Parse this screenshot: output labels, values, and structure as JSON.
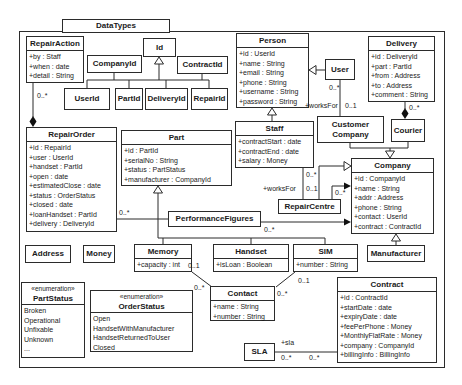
{
  "package": {
    "title": "DataTypes"
  },
  "colors": {
    "line": "#2b2b2b",
    "background": "#ffffff"
  },
  "classes": {
    "repairAction": {
      "name": "RepairAction",
      "attributes": [
        "+by : Staff",
        "+when : date",
        "+detail : String"
      ]
    },
    "id": {
      "name": "Id"
    },
    "companyId": {
      "name": "CompanyId"
    },
    "contractId": {
      "name": "ContractId"
    },
    "userId": {
      "name": "UserId"
    },
    "partId": {
      "name": "PartId"
    },
    "deliveryId": {
      "name": "DeliveryId"
    },
    "repairId": {
      "name": "RepairId"
    },
    "person": {
      "name": "Person",
      "attributes": [
        "+id : UserId",
        "+name : String",
        "+email : String",
        "+phone : String",
        "+username : String",
        "+password : String"
      ]
    },
    "user": {
      "name": "User"
    },
    "delivery": {
      "name": "Delivery",
      "attributes": [
        "+id : DeliveryId",
        "+part : PartId",
        "+from : Address",
        "+to : Address",
        "+comment : String"
      ]
    },
    "repairOrder": {
      "name": "RepairOrder",
      "attributes": [
        "+id : RepairId",
        "+user : UserId",
        "+handset : PartId",
        "+open : date",
        "+estimatedClose : date",
        "+status : OrderStatus",
        "+closed : date",
        "+loanHandset : PartId",
        "+delivery : DeliveryId"
      ]
    },
    "part": {
      "name": "Part",
      "attributes": [
        "+id : PartId",
        "+serialNo : String",
        "+status : PartStatus",
        "+manufacturer : CompanyId"
      ]
    },
    "staff": {
      "name": "Staff",
      "attributes": [
        "+contractStart : date",
        "+contractEnd : date",
        "+salary : Money"
      ]
    },
    "customerCompany": {
      "name": "Customer Company"
    },
    "courier": {
      "name": "Courier"
    },
    "company": {
      "name": "Company",
      "attributes": [
        "+id : CompanyId",
        "+name : String",
        "+addr : Address",
        "+phone : String",
        "+contact : UserId",
        "+contract : ContractId"
      ]
    },
    "repairCentre": {
      "name": "RepairCentre"
    },
    "performanceFigures": {
      "name": "PerformanceFigures"
    },
    "address": {
      "name": "Address"
    },
    "money": {
      "name": "Money"
    },
    "memory": {
      "name": "Memory",
      "attributes": [
        "+capacity : int"
      ]
    },
    "handset": {
      "name": "Handset",
      "attributes": [
        "+isLoan : Boolean"
      ]
    },
    "sim": {
      "name": "SIM",
      "attributes": [
        "+number : String"
      ]
    },
    "manufacturer": {
      "name": "Manufacturer"
    },
    "partStatus": {
      "stereotype": "«enumeration»",
      "name": "PartStatus",
      "literals": [
        "Broken",
        "Operational",
        "Unfixable",
        "Unknown",
        "..."
      ]
    },
    "orderStatus": {
      "stereotype": "«enumeration»",
      "name": "OrderStatus",
      "literals": [
        "Open",
        "HandsetWithManufacturer",
        "HandsetReturnedToUser",
        "Closed"
      ]
    },
    "contact": {
      "name": "Contact",
      "attributes": [
        "+name : String",
        "+number : String"
      ]
    },
    "billingInfo": {
      "name": "BillingInfo"
    },
    "sla": {
      "name": "SLA"
    },
    "contract": {
      "name": "Contract",
      "attributes": [
        "+id : ContractId",
        "+startDate : date",
        "+expiryDate : date",
        "+feePerPhone : Money",
        "+MonthlyFlatRate : Money",
        "+company : CompanyId",
        "+billingInfo : BillingInfo"
      ]
    }
  },
  "labels": {
    "repairaction_end": "0..*",
    "repairorder_pf": "0..*",
    "user_end": "0..*",
    "worksfor_user": "+worksFor",
    "customer_company_end": "0..1",
    "delivery_end": "0..*",
    "staff_end": "0..*",
    "worksfor_staff": "+worksFor",
    "repaircentre_end": "0..1",
    "repaircentre_company": "0..*",
    "pf_company": "0..*",
    "memory_end": "0..1",
    "contact_end_mem": "0..*",
    "sim_end": "0..1",
    "contact_end_sim": "0..*",
    "sla_role": "+sla",
    "sla_end": "0..*",
    "contract_end": "0..*"
  }
}
